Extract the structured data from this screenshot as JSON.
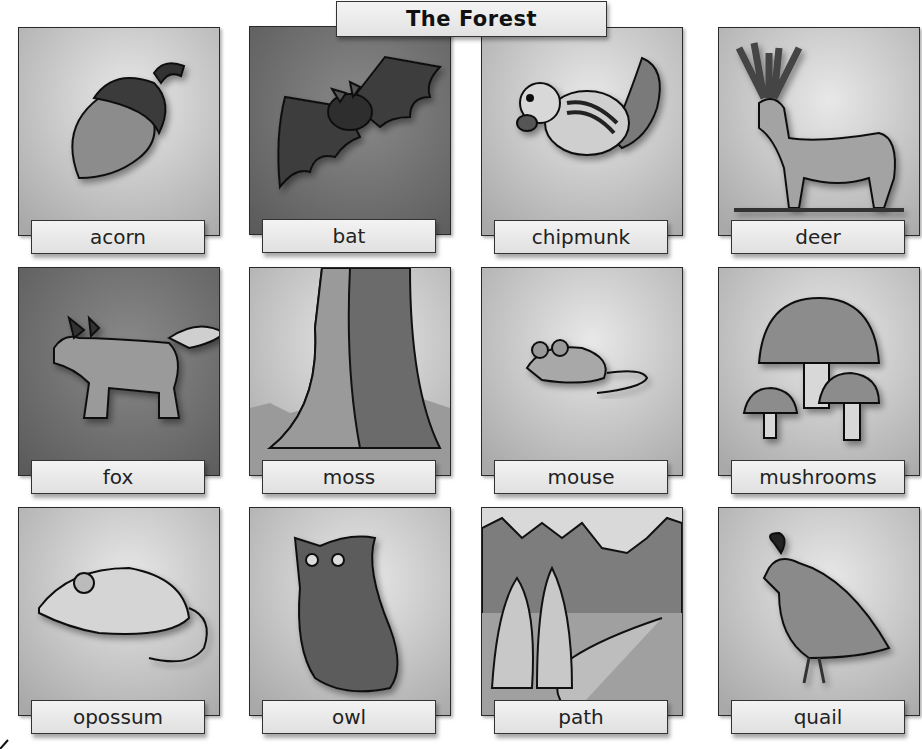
{
  "title": "The Forest",
  "cards": [
    {
      "label": "acorn",
      "icon": "acorn-icon",
      "bg": "light"
    },
    {
      "label": "bat",
      "icon": "bat-icon",
      "bg": "dark"
    },
    {
      "label": "chipmunk",
      "icon": "chipmunk-icon",
      "bg": "light"
    },
    {
      "label": "deer",
      "icon": "deer-icon",
      "bg": "light"
    },
    {
      "label": "fox",
      "icon": "fox-icon",
      "bg": "dark"
    },
    {
      "label": "moss",
      "icon": "moss-tree-icon",
      "bg": "light"
    },
    {
      "label": "mouse",
      "icon": "mouse-icon",
      "bg": "light"
    },
    {
      "label": "mushrooms",
      "icon": "mushrooms-icon",
      "bg": "light"
    },
    {
      "label": "opossum",
      "icon": "opossum-icon",
      "bg": "light"
    },
    {
      "label": "owl",
      "icon": "owl-icon",
      "bg": "light"
    },
    {
      "label": "path",
      "icon": "forest-path-icon",
      "bg": "scene"
    },
    {
      "label": "quail",
      "icon": "quail-icon",
      "bg": "light"
    }
  ]
}
